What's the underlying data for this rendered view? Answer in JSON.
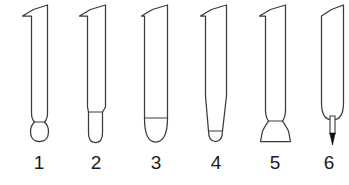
{
  "figure": {
    "background_color": "#ffffff",
    "line_color": "#3a3a3a",
    "accent_color": "#111111",
    "label_color": "#1b1b1b",
    "item_count": 6,
    "orientation": "vertical",
    "style": "technical line art"
  },
  "items": [
    {
      "number": "1",
      "label": "1",
      "name": "ball-tip-instrument",
      "tip_type": "ball end",
      "tip_description": "straight parallel shaft ending in a narrow neck with a round bulbous ball",
      "has_shoulder_line": true,
      "center_x": 39,
      "label_x": 24
    },
    {
      "number": "2",
      "label": "2",
      "name": "narrow-round-tip-instrument",
      "tip_type": "narrow rounded end",
      "tip_description": "shaft steps inward at a shoulder then continues as a narrow stem with a half-round tip",
      "has_shoulder_line": true,
      "center_x": 96,
      "label_x": 81
    },
    {
      "number": "3",
      "label": "3",
      "name": "full-width-round-tip-instrument",
      "tip_type": "full width rounded end",
      "tip_description": "full width shaft closing in a wide U-shaped rounded end with a straight cross line",
      "has_shoulder_line": true,
      "center_x": 156,
      "label_x": 141
    },
    {
      "number": "4",
      "label": "4",
      "name": "tapered-round-tip-instrument",
      "tip_type": "tapered rounded end",
      "tip_description": "shaft tapers gradually toward the base and finishes in a small rounded tip",
      "has_shoulder_line": true,
      "center_x": 216,
      "label_x": 201
    },
    {
      "number": "5",
      "label": "5",
      "name": "flared-flat-base-instrument",
      "tip_type": "flared flat base",
      "tip_description": "shaft narrows to a waist then flares outward into a trumpet shape with a flat bottom",
      "has_shoulder_line": true,
      "center_x": 275,
      "label_x": 260
    },
    {
      "number": "6",
      "label": "6",
      "name": "needle-point-instrument",
      "tip_type": "needle point",
      "tip_description": "shaft ends in a rounded shoulder from which a thin straight needle projects to a solid black point",
      "has_shoulder_line": false,
      "center_x": 329,
      "label_x": 314
    }
  ]
}
